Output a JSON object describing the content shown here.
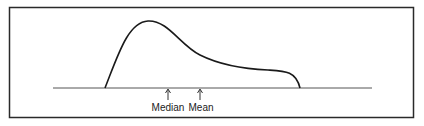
{
  "diagram": {
    "type": "right-skewed distribution",
    "labels": {
      "median": "Median",
      "mean": "Mean"
    },
    "colors": {
      "frame": "#2a2a2a",
      "curve": "#1a1a1a",
      "baseline": "#555555",
      "text": "#222222"
    }
  }
}
